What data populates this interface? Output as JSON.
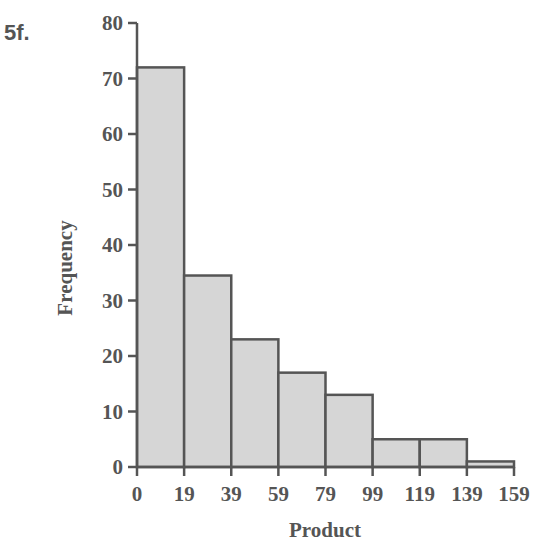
{
  "figure_label": "5f.",
  "chart_data": {
    "type": "bar",
    "subtype": "histogram",
    "title": "",
    "xlabel": "Product",
    "ylabel": "Frequency",
    "categories": [
      "0-19",
      "19-39",
      "39-59",
      "59-79",
      "79-99",
      "99-119",
      "119-139",
      "139-159"
    ],
    "bin_edges": [
      0,
      19,
      39,
      59,
      79,
      99,
      119,
      139,
      159
    ],
    "x_tick_labels": [
      "0",
      "19",
      "39",
      "59",
      "79",
      "99",
      "119",
      "139",
      "159"
    ],
    "values": [
      72,
      34.5,
      23,
      17,
      13,
      5,
      5,
      1
    ],
    "ylim": [
      0,
      80
    ],
    "y_ticks": [
      0,
      10,
      20,
      30,
      40,
      50,
      60,
      70,
      80
    ],
    "grid": false,
    "legend": null
  },
  "colors": {
    "bar_fill": "#d6d6d6",
    "bar_stroke": "#555555",
    "axis": "#555555",
    "text": "#555555"
  }
}
